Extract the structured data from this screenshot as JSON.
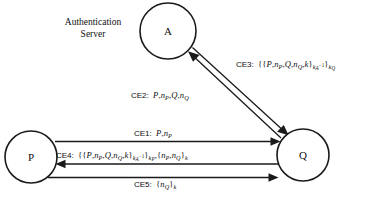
{
  "diagram": {
    "title_note": "Authentication protocol message sequence diagram",
    "background_color": "#ffffff",
    "line_color": "#1a1a1a",
    "nodes": [
      {
        "id": "A",
        "label": "A",
        "cx": 168,
        "cy": 31,
        "r": 28,
        "caption_line1": "Authentication",
        "caption_line2": "Server"
      },
      {
        "id": "P",
        "label": "P",
        "cx": 31,
        "cy": 157,
        "r": 26
      },
      {
        "id": "Q",
        "label": "Q",
        "cx": 303,
        "cy": 155,
        "r": 26
      }
    ],
    "server_caption": {
      "line1": "Authentication",
      "line2": "Server",
      "x": 93,
      "y": 28
    },
    "messages": [
      {
        "id": "CE1",
        "tag": "CE1:",
        "from": "P",
        "to": "Q",
        "body_plain": "P, nP",
        "direction": "right"
      },
      {
        "id": "CE2",
        "tag": "CE2:",
        "from": "Q",
        "to": "A",
        "body_plain": "P, nP, Q, nQ",
        "direction": "up-left"
      },
      {
        "id": "CE3",
        "tag": "CE3:",
        "from": "A",
        "to": "Q",
        "body_plain": "{{P, nP, Q, nQ, k}kA-1}kQ",
        "direction": "down-right"
      },
      {
        "id": "CE4",
        "tag": "CE4:",
        "from": "Q",
        "to": "P",
        "body_plain": "{{P, nP, Q, nQ, k}kA-1}kP, {nP, nQ}k",
        "direction": "left"
      },
      {
        "id": "CE5",
        "tag": "CE5:",
        "from": "P",
        "to": "Q",
        "body_plain": "{nQ}k",
        "direction": "right"
      }
    ]
  }
}
